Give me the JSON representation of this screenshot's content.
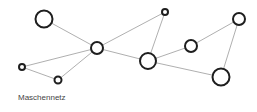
{
  "caption": "Maschennetz",
  "colors": {
    "edge": "#9a9a9a",
    "node_stroke": "#1e1e1e",
    "node_fill": "#ffffff",
    "caption": "#444444"
  },
  "network": {
    "type": "mesh",
    "nodes": [
      {
        "id": "n1",
        "x": 44,
        "y": 19,
        "r": 8.5
      },
      {
        "id": "n2",
        "x": 97,
        "y": 48,
        "r": 6
      },
      {
        "id": "n3",
        "x": 22,
        "y": 67,
        "r": 3
      },
      {
        "id": "n4",
        "x": 58,
        "y": 80,
        "r": 3.5
      },
      {
        "id": "n5",
        "x": 165,
        "y": 12,
        "r": 3
      },
      {
        "id": "n6",
        "x": 148,
        "y": 61,
        "r": 8
      },
      {
        "id": "n7",
        "x": 191,
        "y": 46,
        "r": 6
      },
      {
        "id": "n8",
        "x": 239,
        "y": 19,
        "r": 6
      },
      {
        "id": "n9",
        "x": 221,
        "y": 77,
        "r": 8.5
      }
    ],
    "edges": [
      [
        "n1",
        "n2"
      ],
      [
        "n3",
        "n2"
      ],
      [
        "n3",
        "n4"
      ],
      [
        "n4",
        "n2"
      ],
      [
        "n2",
        "n5"
      ],
      [
        "n2",
        "n6"
      ],
      [
        "n5",
        "n6"
      ],
      [
        "n6",
        "n7"
      ],
      [
        "n7",
        "n8"
      ],
      [
        "n6",
        "n9"
      ],
      [
        "n8",
        "n9"
      ]
    ]
  }
}
